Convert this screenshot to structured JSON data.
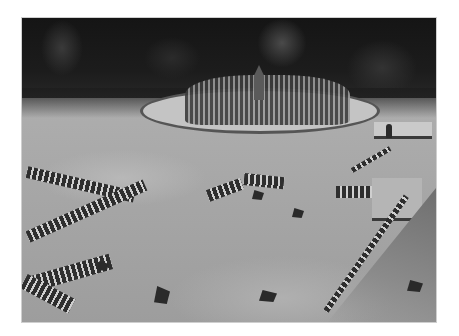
{
  "image": {
    "type": "photograph",
    "color_mode": "grayscale",
    "description": "Black-and-white photograph of an ancient stone sanctuary site in a forest clearing: a circular sanctuary of standing stone posts in the background, rows of short stone pillars forming rectangular outlines in the foreground grass, and a stone-lined path on the right.",
    "frame": {
      "x": 21,
      "y": 17,
      "width": 416,
      "height": 306
    },
    "palette": {
      "forest": "#1c1c1c",
      "grass": "#a9a9a9",
      "stones": "#2e2e2e",
      "highlights": "#cfcfcf",
      "background": "#ffffff"
    }
  }
}
